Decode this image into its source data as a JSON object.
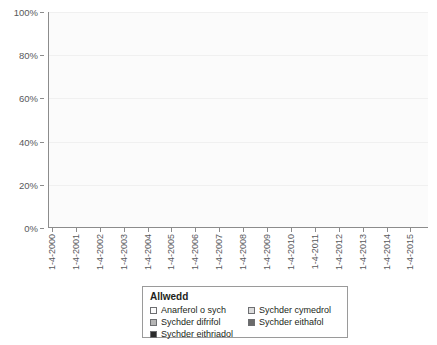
{
  "chart_data": {
    "type": "area",
    "title": "",
    "xlabel": "",
    "ylabel": "",
    "ylim": [
      0,
      100
    ],
    "grid": true,
    "stacked": true,
    "legend_position": "bottom",
    "y_ticks": [
      "0%",
      "20%",
      "40%",
      "60%",
      "80%",
      "100%"
    ],
    "y_tick_values": [
      0,
      20,
      40,
      60,
      80,
      100
    ],
    "categories": [
      "1-4-2000",
      "1-4-2001",
      "1-4-2002",
      "1-4-2003",
      "1-4-2004",
      "1-4-2005",
      "1-4-2006",
      "1-4-2007",
      "1-4-2008",
      "1-4-2009",
      "1-4-2010",
      "1-4-2011",
      "1-4-2012",
      "1-4-2013",
      "1-4-2014",
      "1-4-2015"
    ],
    "series": [
      {
        "name": "Anarferol o sych",
        "color": "#f2f2f2",
        "values": [
          0,
          0,
          14,
          22,
          16,
          8,
          3,
          2,
          26,
          24,
          12,
          3,
          0,
          14,
          26,
          30
        ]
      },
      {
        "name": "Sychder cymedrol",
        "color": "#d4d4d4",
        "values": [
          0,
          0,
          18,
          26,
          14,
          7,
          2,
          2,
          28,
          22,
          10,
          2,
          0,
          18,
          30,
          28
        ]
      },
      {
        "name": "Sychder difrifol",
        "color": "#b5b5b5",
        "values": [
          0,
          0,
          8,
          14,
          5,
          2,
          0,
          0,
          16,
          9,
          4,
          0,
          0,
          10,
          18,
          16
        ]
      },
      {
        "name": "Sychder eithafol",
        "color": "#8a8a8a",
        "values": [
          0,
          0,
          4,
          10,
          2,
          0,
          0,
          0,
          9,
          4,
          1,
          0,
          0,
          5,
          14,
          12
        ]
      },
      {
        "name": "Sychder eithriadol",
        "color": "#3b3b3b",
        "values": [
          0,
          0,
          2,
          8,
          1,
          0,
          0,
          0,
          5,
          2,
          0,
          0,
          0,
          2,
          10,
          6
        ]
      }
    ],
    "x_tick_labels": [
      "1-4-2000",
      "1-4-2001",
      "1-4-2002",
      "1-4-2003",
      "1-4-2004",
      "1-4-2005",
      "1-4-2006",
      "1-4-2007",
      "1-4-2008",
      "1-4-2009",
      "1-4-2010",
      "1-4-2011",
      "1-4-2012",
      "1-4-2013",
      "1-4-2014",
      "1-4-2015"
    ],
    "colors": {
      "plot_background": "#fbfbfb",
      "axis": "#8c8c8c",
      "grid": "#f0f0f0",
      "text": "#58595b"
    }
  },
  "legend": {
    "title": "Allwedd",
    "items": [
      {
        "label": "Anarferol o sych",
        "color": "#fcfcfc"
      },
      {
        "label": "Sychder cymedrol",
        "color": "#dcdcdc"
      },
      {
        "label": "Sychder difrifol",
        "color": "#b5b5b5"
      },
      {
        "label": "Sychder eithafol",
        "color": "#6b6b6b"
      },
      {
        "label": "Sychder eithriadol",
        "color": "#2b2b2b"
      }
    ]
  },
  "y_axis": {
    "labels": [
      "100%",
      "80%",
      "60%",
      "40%",
      "20%",
      "0%"
    ]
  }
}
